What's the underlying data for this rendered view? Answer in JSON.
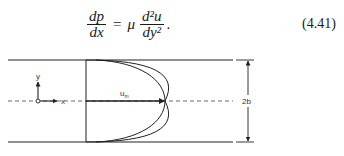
{
  "equation": {
    "lhs_numerator": "dp",
    "lhs_denominator": "dx",
    "equals": "=",
    "coefficient": "μ",
    "rhs_numerator": "d²u",
    "rhs_denominator": "dy²",
    "trailing": ".",
    "number": "(4.41)"
  },
  "figure": {
    "labels": {
      "y_axis": "y",
      "x_axis": "x",
      "max_velocity": "u",
      "max_velocity_sub": "m",
      "channel_width": "2b"
    },
    "colors": {
      "line": "#222222",
      "dashed": "#444444"
    }
  }
}
